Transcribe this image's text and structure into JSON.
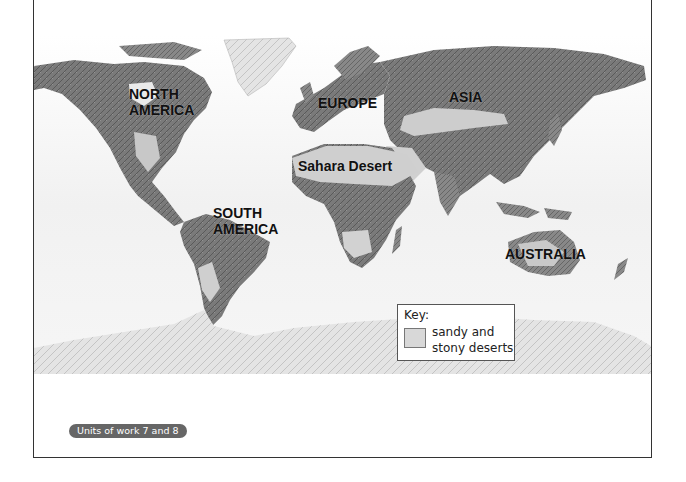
{
  "map": {
    "type": "world physical relief map",
    "labels": {
      "north_america_line1": "NORTH",
      "north_america_line2": "AMERICA",
      "europe": "EUROPE",
      "asia": "ASIA",
      "sahara": "Sahara Desert",
      "south_america_line1": "SOUTH",
      "south_america_line2": "AMERICA",
      "australia": "AUSTRALIA"
    },
    "key": {
      "title": "Key:",
      "swatch_color": "#d8d8d8",
      "item_line1": "sandy and",
      "item_line2": "stony deserts"
    }
  },
  "footer": {
    "badge": "Units of work 7 and 8"
  }
}
